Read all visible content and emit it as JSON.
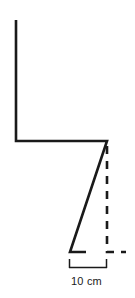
{
  "figure": {
    "title": "",
    "background_color": "#ffffff",
    "stroke_color": "#1a1a1a",
    "canvas": {
      "width": 135,
      "height": 298
    }
  },
  "geometry": {
    "solid_path": {
      "name": "bent-profile-outline",
      "points": [
        {
          "x": 16,
          "y": 20
        },
        {
          "x": 16,
          "y": 141
        },
        {
          "x": 107,
          "y": 141
        },
        {
          "x": 70,
          "y": 252
        },
        {
          "x": 86,
          "y": 252
        }
      ],
      "stroke_width": 2.6
    },
    "dashed_path": {
      "name": "vertical-reference-line",
      "points": [
        {
          "x": 107,
          "y": 146
        },
        {
          "x": 107,
          "y": 252
        },
        {
          "x": 126,
          "y": 252
        }
      ],
      "stroke_width": 2.6,
      "dash_pattern": "8 7"
    },
    "dimension": {
      "name": "width-dimension-bracket",
      "x_start": 69,
      "x_end": 107,
      "y_line": 268,
      "tick_top": 259,
      "stroke_width": 1.5
    }
  },
  "labels": {
    "dimension_value": "10 cm"
  }
}
